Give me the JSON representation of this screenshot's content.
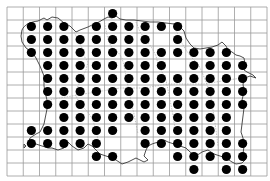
{
  "map": {
    "type": "distribution-grid-map",
    "region_shape": "island outline with parish boundaries",
    "grid": {
      "columns": 16,
      "rows": 13,
      "origin_x": 7,
      "origin_y": 7,
      "cell_width": 16.25,
      "cell_height": 13
    },
    "colors": {
      "background": "#ffffff",
      "grid": "#9a9a9a",
      "coastline": "#3a3a3a",
      "dot": "#000000"
    },
    "occupied_cells_by_row": [
      {
        "row": 0,
        "cols": [
          6
        ]
      },
      {
        "row": 1,
        "cols": [
          1,
          2,
          3,
          5,
          6,
          7,
          8,
          9,
          10
        ]
      },
      {
        "row": 2,
        "cols": [
          1,
          2,
          3,
          4,
          5,
          6,
          7,
          8,
          10
        ]
      },
      {
        "row": 3,
        "cols": [
          1,
          2,
          3,
          4,
          5,
          6,
          7,
          8,
          9,
          10,
          11,
          12,
          13
        ]
      },
      {
        "row": 4,
        "cols": [
          2,
          3,
          4,
          5,
          6,
          7,
          8,
          9,
          11,
          12,
          13,
          14
        ]
      },
      {
        "row": 5,
        "cols": [
          2,
          3,
          4,
          5,
          6,
          7,
          8,
          9,
          10,
          11,
          12,
          13,
          14
        ]
      },
      {
        "row": 6,
        "cols": [
          2,
          3,
          4,
          5,
          6,
          7,
          8,
          9,
          10,
          11,
          12,
          13,
          14
        ]
      },
      {
        "row": 7,
        "cols": [
          2,
          3,
          4,
          5,
          6,
          7,
          8,
          9,
          10,
          11,
          12,
          13,
          14
        ]
      },
      {
        "row": 8,
        "cols": [
          3,
          4,
          5,
          6,
          7,
          8,
          9,
          10,
          11,
          12,
          13
        ]
      },
      {
        "row": 9,
        "cols": [
          1,
          2,
          3,
          4,
          5,
          6,
          8,
          9,
          10,
          11,
          12,
          13
        ]
      },
      {
        "row": 10,
        "cols": [
          1,
          2,
          3,
          4,
          5,
          8,
          9,
          10,
          11,
          12,
          13,
          14
        ]
      },
      {
        "row": 11,
        "cols": [
          5,
          6,
          10,
          11,
          12,
          13,
          14
        ]
      },
      {
        "row": 12,
        "cols": [
          11,
          13,
          14
        ]
      }
    ],
    "total_occupied_cells": 133
  }
}
